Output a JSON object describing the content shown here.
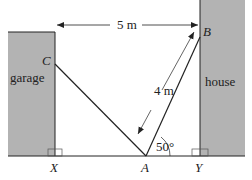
{
  "diagram": {
    "labels": {
      "garage": "garage",
      "house": "house",
      "distance": "5 m",
      "ladder_length": "4 m",
      "angle": "50°",
      "point_a": "A",
      "point_b": "B",
      "point_c": "C",
      "point_x": "X",
      "point_y": "Y"
    },
    "colors": {
      "building_fill": "#b3b3b3",
      "line": "#222222",
      "background": "#ffffff"
    }
  }
}
